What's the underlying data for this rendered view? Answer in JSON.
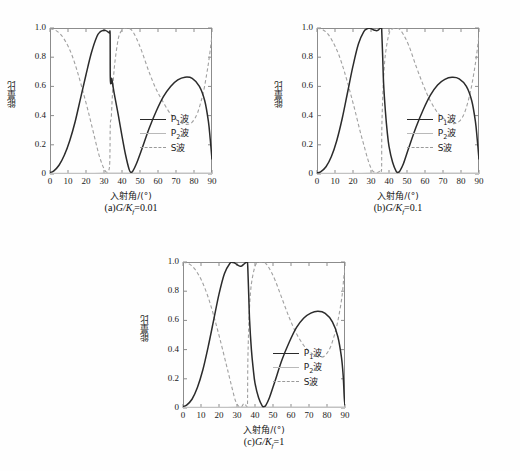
{
  "figure": {
    "background_color": "#fefefe",
    "axis_color": "#8c8c8c"
  },
  "common": {
    "ylabel": "能量比",
    "xlabel": "入射角/(°)",
    "y_ticks": [
      "0",
      "0.2",
      "0.4",
      "0.6",
      "0.8",
      "1.0"
    ],
    "x_ticks": [
      "0",
      "10",
      "20",
      "30",
      "40",
      "50",
      "60",
      "70",
      "80",
      "90"
    ],
    "legend": [
      {
        "label": "P",
        "sub": "1",
        "suffix": "波",
        "style": "solid-dark",
        "color": "#2b2b2b"
      },
      {
        "label": "P",
        "sub": "2",
        "suffix": "波",
        "style": "solid-light",
        "color": "#c2c2c2"
      },
      {
        "label": "S",
        "sub": "",
        "suffix": "波",
        "style": "dashed",
        "color": "#a0a0a0"
      }
    ]
  },
  "chart_data": [
    {
      "type": "line",
      "panel": "a",
      "title": "(a)G/Kf=0.01",
      "caption_prefix": "(a)",
      "caption_var": "G/K",
      "caption_sub": "f",
      "caption_value": "=0.01",
      "xlabel": "入射角/(°)",
      "ylabel": "能量比",
      "xlim": [
        0,
        90
      ],
      "ylim": [
        0,
        1.0
      ],
      "grid": false,
      "legend_position": "center-right",
      "series": [
        {
          "name": "P1波",
          "style": "solid-dark",
          "x": [
            0,
            2,
            5,
            8,
            11,
            14,
            17,
            20,
            23,
            26,
            28,
            30,
            31,
            32,
            33,
            33.4,
            33.5,
            34,
            34.3,
            35,
            36,
            38,
            40,
            42,
            44,
            45,
            46,
            48,
            51,
            55,
            59,
            63,
            67,
            71,
            75,
            79,
            83,
            86,
            88,
            89,
            90
          ],
          "y": [
            0.01,
            0.02,
            0.06,
            0.13,
            0.23,
            0.36,
            0.52,
            0.68,
            0.83,
            0.94,
            0.975,
            0.985,
            0.982,
            0.975,
            0.965,
            0.955,
            0.66,
            0.62,
            0.655,
            0.6,
            0.53,
            0.4,
            0.26,
            0.13,
            0.03,
            0.012,
            0.02,
            0.07,
            0.17,
            0.31,
            0.43,
            0.53,
            0.6,
            0.645,
            0.663,
            0.655,
            0.6,
            0.5,
            0.36,
            0.24,
            0.1
          ]
        },
        {
          "name": "P2波",
          "style": "solid-light",
          "x": [
            0,
            10,
            20,
            30,
            40,
            50,
            60,
            70,
            80,
            90
          ],
          "y": [
            0.004,
            0.004,
            0.004,
            0.005,
            0.005,
            0.005,
            0.005,
            0.005,
            0.005,
            0.005
          ]
        },
        {
          "name": "S波",
          "style": "dashed",
          "x": [
            0,
            3,
            6,
            9,
            12,
            15,
            18,
            21,
            24,
            27,
            29,
            30.5,
            31.5,
            32.5,
            33.2,
            33.5,
            34,
            34.5,
            35,
            36,
            38,
            40,
            42,
            44,
            45,
            46,
            48,
            51,
            55,
            59,
            63,
            67,
            70,
            73,
            76,
            79,
            82,
            85,
            87,
            88.5,
            90
          ],
          "y": [
            0.995,
            0.985,
            0.955,
            0.9,
            0.82,
            0.71,
            0.58,
            0.44,
            0.29,
            0.14,
            0.065,
            0.025,
            0.012,
            0.02,
            0.08,
            0.34,
            0.38,
            0.5,
            0.61,
            0.76,
            0.93,
            0.985,
            1.0,
            0.995,
            0.99,
            0.975,
            0.93,
            0.84,
            0.7,
            0.58,
            0.49,
            0.41,
            0.375,
            0.35,
            0.34,
            0.355,
            0.42,
            0.55,
            0.68,
            0.8,
            0.95
          ]
        }
      ]
    },
    {
      "type": "line",
      "panel": "b",
      "title": "(b)G/Kf=0.1",
      "caption_prefix": "(b)",
      "caption_var": "G/K",
      "caption_sub": "f",
      "caption_value": "=0.1",
      "xlabel": "入射角/(°)",
      "ylabel": "能量比",
      "xlim": [
        0,
        90
      ],
      "ylim": [
        0,
        1.0
      ],
      "grid": false,
      "legend_position": "center-right",
      "series": [
        {
          "name": "P1波",
          "style": "solid-dark",
          "x": [
            0,
            2,
            5,
            8,
            11,
            14,
            17,
            20,
            23,
            26,
            28,
            29,
            30,
            31,
            32,
            33,
            34,
            34.5,
            35,
            35.5,
            35.9,
            36,
            36.5,
            37,
            38,
            39,
            40,
            42,
            44,
            45,
            46,
            48,
            51,
            55,
            59,
            63,
            67,
            71,
            75,
            79,
            83,
            86,
            88,
            89,
            90
          ],
          "y": [
            0.008,
            0.015,
            0.05,
            0.12,
            0.23,
            0.38,
            0.56,
            0.74,
            0.89,
            0.975,
            0.995,
            0.998,
            0.996,
            0.99,
            0.985,
            0.982,
            0.985,
            0.992,
            0.997,
            0.999,
            1.0,
            0.97,
            0.8,
            0.62,
            0.43,
            0.29,
            0.19,
            0.08,
            0.018,
            0.012,
            0.02,
            0.07,
            0.18,
            0.32,
            0.44,
            0.54,
            0.61,
            0.648,
            0.662,
            0.652,
            0.6,
            0.5,
            0.36,
            0.24,
            0.1
          ]
        },
        {
          "name": "P2波",
          "style": "solid-light",
          "x": [
            0,
            10,
            20,
            30,
            40,
            50,
            60,
            70,
            80,
            90
          ],
          "y": [
            0.004,
            0.004,
            0.004,
            0.005,
            0.005,
            0.005,
            0.005,
            0.005,
            0.005,
            0.005
          ]
        },
        {
          "name": "S波",
          "style": "dashed",
          "x": [
            0,
            3,
            6,
            9,
            12,
            15,
            18,
            21,
            24,
            26,
            28,
            29.5,
            31,
            33,
            34,
            35,
            35.5,
            35.9,
            36,
            36.5,
            37,
            38,
            40,
            42,
            44,
            45,
            46,
            48,
            51,
            55,
            59,
            63,
            67,
            70,
            73,
            76,
            79,
            82,
            85,
            87,
            88.5,
            90
          ],
          "y": [
            0.998,
            0.99,
            0.96,
            0.9,
            0.82,
            0.71,
            0.58,
            0.44,
            0.29,
            0.2,
            0.11,
            0.055,
            0.02,
            0.008,
            0.012,
            0.02,
            0.03,
            0.04,
            0.3,
            0.52,
            0.66,
            0.82,
            0.96,
            0.995,
            1.0,
            0.998,
            0.99,
            0.955,
            0.88,
            0.74,
            0.61,
            0.5,
            0.42,
            0.385,
            0.355,
            0.345,
            0.36,
            0.42,
            0.55,
            0.68,
            0.8,
            0.95
          ]
        }
      ]
    },
    {
      "type": "line",
      "panel": "c",
      "title": "(c)G/Kf=1",
      "caption_prefix": "(c)",
      "caption_var": "G/K",
      "caption_sub": "f",
      "caption_value": "=1",
      "xlabel": "入射角/(°)",
      "ylabel": "能量比",
      "xlim": [
        0,
        90
      ],
      "ylim": [
        0,
        1.0
      ],
      "grid": false,
      "legend_position": "center-right",
      "series": [
        {
          "name": "P1波",
          "style": "solid-dark",
          "x": [
            0,
            2,
            5,
            8,
            11,
            14,
            17,
            20,
            23,
            26,
            27.5,
            28.5,
            30,
            31.5,
            32.5,
            33.5,
            34.5,
            35.3,
            35.8,
            36,
            36.5,
            37,
            38,
            39,
            40,
            42,
            44,
            45,
            46,
            48,
            51,
            55,
            59,
            63,
            67,
            71,
            75,
            79,
            83,
            86,
            88,
            89,
            89.6,
            90
          ],
          "y": [
            0.01,
            0.02,
            0.06,
            0.14,
            0.26,
            0.42,
            0.6,
            0.78,
            0.92,
            0.99,
            0.997,
            0.995,
            0.982,
            0.972,
            0.972,
            0.982,
            0.993,
            0.998,
            0.999,
            0.96,
            0.78,
            0.6,
            0.4,
            0.27,
            0.17,
            0.07,
            0.015,
            0.01,
            0.018,
            0.07,
            0.18,
            0.33,
            0.45,
            0.55,
            0.615,
            0.65,
            0.662,
            0.648,
            0.59,
            0.49,
            0.35,
            0.22,
            0.07,
            0.02
          ]
        },
        {
          "name": "P2波",
          "style": "solid-light",
          "x": [
            0,
            10,
            20,
            30,
            40,
            50,
            60,
            70,
            80,
            90
          ],
          "y": [
            0.004,
            0.004,
            0.004,
            0.005,
            0.005,
            0.005,
            0.005,
            0.005,
            0.005,
            0.005
          ]
        },
        {
          "name": "S波",
          "style": "dashed",
          "x": [
            0,
            3,
            6,
            9,
            12,
            15,
            18,
            21,
            24,
            26,
            27.5,
            29,
            30.5,
            32,
            32.8,
            33.4,
            34,
            34.6,
            35.2,
            35.8,
            36,
            36.5,
            37,
            38,
            40,
            42,
            44,
            45,
            46,
            48,
            51,
            55,
            59,
            63,
            67,
            70,
            73,
            76,
            79,
            82,
            85,
            87,
            88.5,
            89.3,
            90
          ],
          "y": [
            0.998,
            0.99,
            0.96,
            0.905,
            0.825,
            0.72,
            0.59,
            0.45,
            0.3,
            0.2,
            0.125,
            0.055,
            0.018,
            0.005,
            0.012,
            0.025,
            0.03,
            0.025,
            0.012,
            0.005,
            0.3,
            0.55,
            0.7,
            0.85,
            0.97,
            0.998,
            1.0,
            0.998,
            0.99,
            0.955,
            0.88,
            0.75,
            0.62,
            0.51,
            0.43,
            0.39,
            0.362,
            0.348,
            0.36,
            0.42,
            0.54,
            0.66,
            0.78,
            0.89,
            0.95
          ]
        }
      ]
    }
  ]
}
